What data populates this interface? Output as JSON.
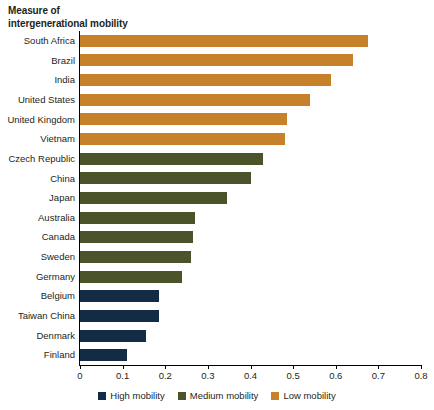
{
  "chart_data": {
    "type": "bar",
    "orientation": "horizontal",
    "title": "Measure of intergenerational mobility",
    "title_lines": [
      "Measure of",
      "intergenerational mobility"
    ],
    "xlabel": "",
    "ylabel": "",
    "xlim": [
      0,
      0.8
    ],
    "xticks": [
      "0",
      "0.1",
      "0.2",
      "0.3",
      "0.4",
      "0.5",
      "0.6",
      "0.7",
      "0.8"
    ],
    "xtick_values": [
      0,
      0.1,
      0.2,
      0.3,
      0.4,
      0.5,
      0.6,
      0.7,
      0.8
    ],
    "grid": false,
    "legend_position": "bottom",
    "categories": [
      "South Africa",
      "Brazil",
      "India",
      "United States",
      "United Kingdom",
      "Vietnam",
      "Czech Republic",
      "China",
      "Japan",
      "Australia",
      "Canada",
      "Sweden",
      "Germany",
      "Belgium",
      "Taiwan China",
      "Denmark",
      "Finland"
    ],
    "values": [
      0.675,
      0.64,
      0.59,
      0.54,
      0.485,
      0.48,
      0.43,
      0.4,
      0.345,
      0.27,
      0.265,
      0.26,
      0.24,
      0.185,
      0.185,
      0.155,
      0.11
    ],
    "groups": [
      "Low mobility",
      "Low mobility",
      "Low mobility",
      "Low mobility",
      "Low mobility",
      "Low mobility",
      "Medium mobility",
      "Medium mobility",
      "Medium mobility",
      "Medium mobility",
      "Medium mobility",
      "Medium mobility",
      "Medium mobility",
      "High mobility",
      "High mobility",
      "High mobility",
      "High mobility"
    ],
    "legend": [
      {
        "label": "High mobility",
        "color": "#132B45"
      },
      {
        "label": "Medium mobility",
        "color": "#4A5329"
      },
      {
        "label": "Low mobility",
        "color": "#C8812B"
      }
    ],
    "colors": {
      "high_mobility": "#132B45",
      "medium_mobility": "#4A5329",
      "low_mobility": "#C8812B",
      "axis": "#000000",
      "text": "#231f20"
    }
  }
}
